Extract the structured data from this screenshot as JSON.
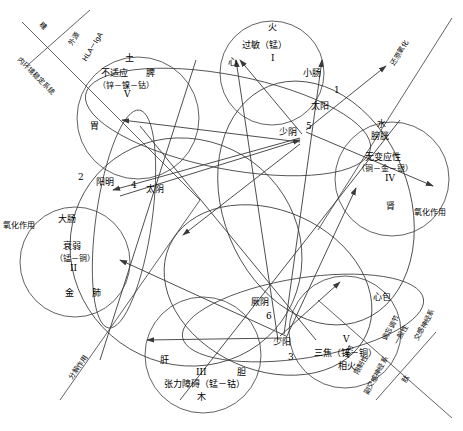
{
  "diagram": {
    "stroke_color": "#3a3a3a",
    "text_color": "#000000",
    "background": "#ffffff"
  },
  "elements": {
    "earth": {
      "phase": "土",
      "condition": "不适应",
      "organ_zang": "脾",
      "minerals": "（锌－镍－钴）",
      "roman": "V",
      "organ_fu": "胃"
    },
    "fire": {
      "phase": "火",
      "condition": "过敏（锰）",
      "roman": "I",
      "organ_zang": "心",
      "organ_fu": "小肠"
    },
    "water": {
      "phase": "水",
      "organ_fu": "膀胱",
      "condition": "无变应性",
      "minerals": "（铜－金－银）",
      "roman": "IV",
      "organ_zang": "肾"
    },
    "metal": {
      "organ_fu": "大肠",
      "condition": "衰弱",
      "minerals": "（锰－铜）",
      "roman": "II",
      "phase": "金",
      "organ_zang": "肺"
    },
    "wood": {
      "organ_zang": "肝",
      "roman": "III",
      "organ_fu": "胆",
      "condition": "张力障碍（锰－钴）",
      "phase": "木"
    },
    "ministerial_fire": {
      "organ_zang": "心包",
      "roman": "V",
      "organ_fu": "三焦（锌－铜）",
      "phase": "相火"
    }
  },
  "meridians": [
    {
      "name": "太阳",
      "number": "1"
    },
    {
      "name": "阳明",
      "number": "2"
    },
    {
      "name": "少阳",
      "number": "3"
    },
    {
      "name": "太阴",
      "number": "4"
    },
    {
      "name": "少阴",
      "number": "5"
    },
    {
      "name": "厥阴",
      "number": "6"
    }
  ],
  "axis_labels": {
    "top_left_a": "糖",
    "top_left_b": "内环境稳定系统",
    "top_left_c": "外源",
    "top_left_d": "HLA－IgA",
    "top_right": "还原氧化",
    "left_oxidation": "氧化作用",
    "right_oxidation": "氧化作用",
    "bottom_left": "分解作用",
    "bottom_right_a": "调节",
    "bottom_right_b": "限制性",
    "bottom_right_c": "副交感神经系",
    "bottom_right_d": "调忘调节",
    "bottom_right_e": "一般性",
    "bottom_right_f": "交感神经系",
    "bottom_right_g": "肽"
  }
}
